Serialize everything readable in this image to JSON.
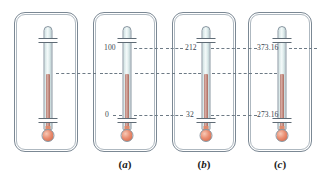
{
  "figure": {
    "background_color": "#ffffff",
    "dash_color": "#6d7a85",
    "frame_color": "#7b8894",
    "mercury_color": "#a96b60",
    "bulb_color": "#d2603f",
    "glass_color": "#e6f1f1"
  },
  "panels": [
    {
      "id": "panel-unlabeled",
      "caption": "",
      "caption_open_paren": "",
      "caption_letter": "",
      "caption_close_paren": "",
      "upper_value": "",
      "lower_value": "",
      "scale_name": "unmarked"
    },
    {
      "id": "panel-celsius",
      "caption": "(a)",
      "caption_open_paren": "(",
      "caption_letter": "a",
      "caption_close_paren": ")",
      "upper_value": "100",
      "lower_value": "0",
      "scale_name": "Celsius"
    },
    {
      "id": "panel-fahrenheit",
      "caption": "(b)",
      "caption_open_paren": "(",
      "caption_letter": "b",
      "caption_close_paren": ")",
      "upper_value": "212",
      "lower_value": "32",
      "scale_name": "Fahrenheit"
    },
    {
      "id": "panel-kelvin",
      "caption": "(c)",
      "caption_open_paren": "(",
      "caption_letter": "c",
      "caption_close_paren": ")",
      "upper_value": "373.16",
      "lower_value": "273.16",
      "scale_name": "Kelvin"
    }
  ]
}
